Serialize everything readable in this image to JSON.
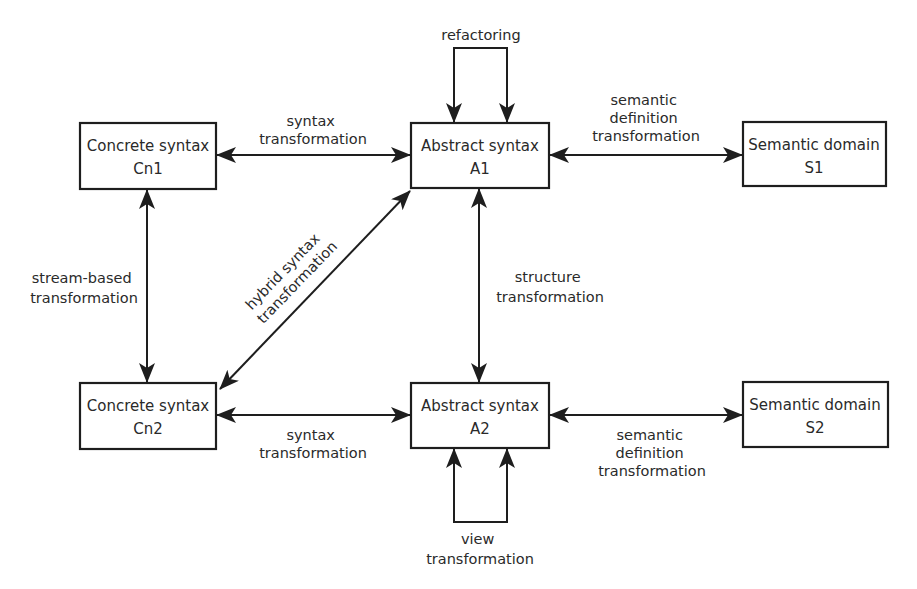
{
  "nodes": {
    "cn1": {
      "line1": "Concrete syntax",
      "line2": "Cn1"
    },
    "a1": {
      "line1": "Abstract syntax",
      "line2": "A1"
    },
    "s1": {
      "line1": "Semantic domain",
      "line2": "S1"
    },
    "cn2": {
      "line1": "Concrete syntax",
      "line2": "Cn2"
    },
    "a2": {
      "line1": "Abstract syntax",
      "line2": "A2"
    },
    "s2": {
      "line1": "Semantic domain",
      "line2": "S2"
    }
  },
  "edges": {
    "refactoring": {
      "line1": "refactoring"
    },
    "syntax_top": {
      "line1": "syntax",
      "line2": "transformation"
    },
    "semantic_top": {
      "line1": "semantic",
      "line2": "definition",
      "line3": "transformation"
    },
    "stream": {
      "line1": "stream-based",
      "line2": "transformation"
    },
    "hybrid": {
      "line1": "hybrid syntax",
      "line2": "transformation"
    },
    "structure": {
      "line1": "structure",
      "line2": "transformation"
    },
    "syntax_bottom": {
      "line1": "syntax",
      "line2": "transformation"
    },
    "semantic_bottom": {
      "line1": "semantic",
      "line2": "definition",
      "line3": "transformation"
    },
    "view": {
      "line1": "view",
      "line2": "transformation"
    }
  }
}
